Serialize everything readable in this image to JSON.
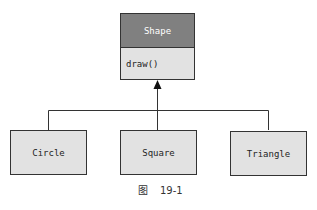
{
  "diagram": {
    "type": "uml-class-inheritance",
    "parent": {
      "name": "Shape",
      "methods": [
        "draw()"
      ],
      "header_color": "#808080",
      "body_color": "#e2e2e2"
    },
    "children": [
      {
        "name": "Circle"
      },
      {
        "name": "Square"
      },
      {
        "name": "Triangle"
      }
    ],
    "child_fill": "#e2e2e2",
    "line_color": "#333333",
    "relationship": "inheritance"
  },
  "caption": {
    "prefix": "图",
    "number": "19-1"
  }
}
